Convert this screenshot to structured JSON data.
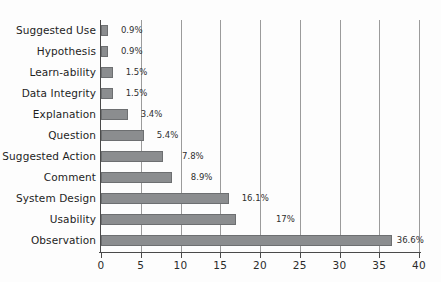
{
  "chart_data": {
    "type": "bar",
    "orientation": "horizontal",
    "title": "",
    "subtitle": "",
    "xlabel": "",
    "ylabel": "",
    "xlim": [
      0,
      40
    ],
    "xticks": [
      0,
      5,
      10,
      15,
      20,
      25,
      30,
      35,
      40
    ],
    "xtick_labels": [
      "0",
      "5",
      "10",
      "15",
      "20",
      "25",
      "30",
      "35",
      "40"
    ],
    "grid": "vertical",
    "legend": "none",
    "categories": [
      "Suggested Use",
      "Hypothesis",
      "Learn-ability",
      "Data Integrity",
      "Explanation",
      "Question",
      "Suggested Action",
      "Comment",
      "System Design",
      "Usability",
      "Observation"
    ],
    "values": [
      0.9,
      0.9,
      1.5,
      1.5,
      3.4,
      5.4,
      7.8,
      8.9,
      16.1,
      17,
      36.6
    ],
    "data_labels": [
      "0.9%",
      "0.9%",
      "1.5%",
      "1.5%",
      "3.4%",
      "5.4%",
      "7.8%",
      "8.9%",
      "16.1%",
      "17%",
      "36.6%"
    ],
    "label_offsets_units": [
      1.6,
      1.6,
      1.6,
      1.6,
      1.6,
      1.6,
      2.4,
      2.4,
      1.6,
      5.0,
      0.6
    ],
    "series": [
      {
        "name": "Percentage of comments",
        "values": [
          0.9,
          0.9,
          1.5,
          1.5,
          3.4,
          5.4,
          7.8,
          8.9,
          16.1,
          17,
          36.6
        ]
      }
    ],
    "colors": {
      "bar_fill": "#8b8d8f",
      "bar_stroke": "#6d6f71",
      "gridline": "#9b9b9b",
      "axis": "#4a4a4a",
      "text": "#1e1e1e",
      "background": "#fdfdfd"
    }
  }
}
